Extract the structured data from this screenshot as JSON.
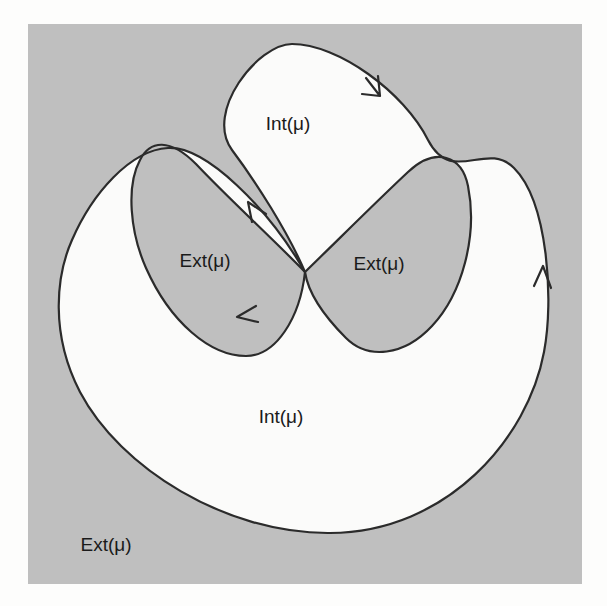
{
  "figure": {
    "background_color": "#fdfdfc",
    "panel_color": "#bfbfbf",
    "interior_fill": "#fbfbfa",
    "curve_color": "#2b2b2b",
    "panel": {
      "x": 28,
      "y": 24,
      "width": 554,
      "height": 560
    },
    "labels": [
      {
        "id": "int-top",
        "text": "Int(μ)",
        "x": 288,
        "y": 125
      },
      {
        "id": "ext-left-lobe",
        "text": "Ext(μ)",
        "x": 205,
        "y": 262
      },
      {
        "id": "ext-right-lobe",
        "text": "Ext(μ)",
        "x": 379,
        "y": 265
      },
      {
        "id": "int-bottom",
        "text": "Int(μ)",
        "x": 281,
        "y": 418
      },
      {
        "id": "ext-outside",
        "text": "Ext(μ)",
        "x": 106,
        "y": 546
      }
    ],
    "crossing_point": {
      "x": 305,
      "y": 272
    },
    "arrows": [
      {
        "id": "arrow-top-right",
        "x": 378,
        "y": 93,
        "angle": 62,
        "direction": "down-right"
      },
      {
        "id": "arrow-right-side",
        "x": 543,
        "y": 272,
        "angle": -91,
        "direction": "up"
      },
      {
        "id": "arrow-inner-up",
        "x": 251,
        "y": 205,
        "angle": -140,
        "direction": "up-left"
      },
      {
        "id": "arrow-inner-down",
        "x": 240,
        "y": 315,
        "angle": 215,
        "direction": "down-left"
      }
    ],
    "curve_paths": {
      "outer_loop": "M 305 272 C 288 232 256 182 232 150 C 204 112 258 44 292 44 C 338 44 404 92 428 140 C 452 186 486 140 514 168 C 548 202 554 300 544 352 C 528 438 448 532 330 533 C 226 534 120 468 80 392 C 50 334 56 276 72 240 C 92 194 130 150 168 148 C 206 146 268 208 305 272",
      "left_lobe": "M 305 272 C 272 238 228 198 196 164 C 170 138 150 140 140 160 C 126 186 130 232 146 268 C 170 322 210 356 246 356 C 276 356 300 318 305 272",
      "right_lobe": "M 305 272 C 340 238 378 200 408 172 C 436 146 462 156 468 186 C 478 236 462 294 432 326 C 404 356 368 360 346 338 C 322 314 308 292 305 272"
    }
  }
}
